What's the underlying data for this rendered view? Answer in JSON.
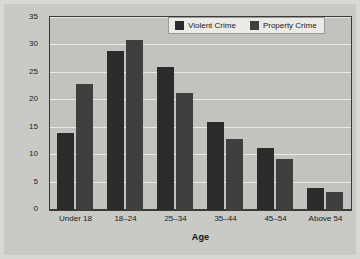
{
  "chart_data": {
    "type": "bar",
    "title": "",
    "xlabel": "Age",
    "ylabel": "Percentage of Total Arrests",
    "categories": [
      "Under 18",
      "18–24",
      "25–34",
      "35–44",
      "45–54",
      "Above 54"
    ],
    "series": [
      {
        "name": "Violent Crime",
        "color": "#2b2b2b",
        "values": [
          14,
          29,
          26,
          16,
          11.3,
          4
        ]
      },
      {
        "name": "Property Crime",
        "color": "#3f3f3f",
        "values": [
          23,
          31,
          21.3,
          13,
          9.3,
          3.3
        ]
      }
    ],
    "ylim": [
      0,
      35
    ],
    "yticks": [
      0,
      5,
      10,
      15,
      20,
      25,
      30,
      35
    ],
    "ytick_labels": [
      "0",
      "5",
      "10",
      "15",
      "20",
      "25",
      "30",
      "35"
    ],
    "grid": true,
    "legend_position": "top-right-inside"
  },
  "legend": {
    "items": [
      {
        "label": "Violent Crime"
      },
      {
        "label": "Property Crime"
      }
    ]
  },
  "colors": {
    "figure_background": "#c9c9c5",
    "plot_background": "#c2c2be",
    "gridline": "#e9e9e6",
    "axis": "#3a3a38",
    "violent": "#2b2b2b",
    "property": "#3f3f3f"
  }
}
